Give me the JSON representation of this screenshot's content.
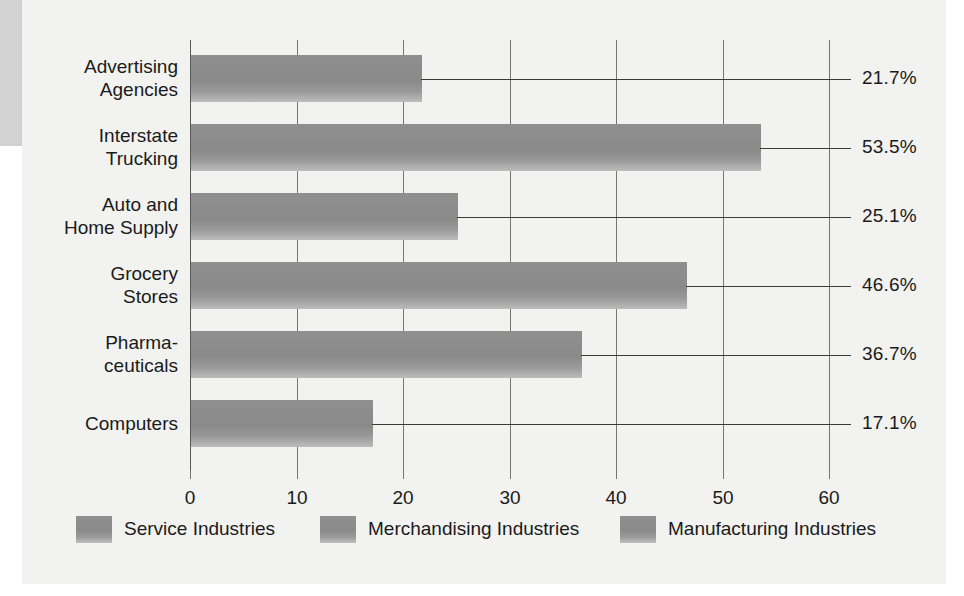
{
  "chart_data": {
    "type": "bar",
    "orientation": "horizontal",
    "title": "",
    "subtitle": "",
    "xlabel": "",
    "ylabel": "",
    "xlim": [
      0,
      60
    ],
    "grid": true,
    "legend_position": "bottom",
    "categories": [
      "Advertising\nAgencies",
      "Interstate\nTrucking",
      "Auto and\nHome Supply",
      "Grocery\nStores",
      "Pharma-\nceuticals",
      "Computers"
    ],
    "values": [
      21.7,
      53.5,
      25.1,
      46.6,
      36.7,
      17.1
    ],
    "value_labels": [
      "21.7%",
      "53.5%",
      "25.1%",
      "46.6%",
      "36.7%",
      "17.1%"
    ],
    "xticks": [
      0,
      10,
      20,
      30,
      40,
      50,
      60
    ],
    "xtick_labels": [
      "0",
      "10",
      "20",
      "30",
      "40",
      "50",
      "60"
    ],
    "legend": [
      "Service Industries",
      "Merchandising Industries",
      "Manufacturing Industries"
    ],
    "colors": {
      "bar": "#8f8f8f",
      "panel_background": "#f2f2f0",
      "grid": "#757575",
      "text": "#1a1a1a",
      "leader_line": "#3a3a3a",
      "edge_block": "#d2d2d2"
    }
  }
}
